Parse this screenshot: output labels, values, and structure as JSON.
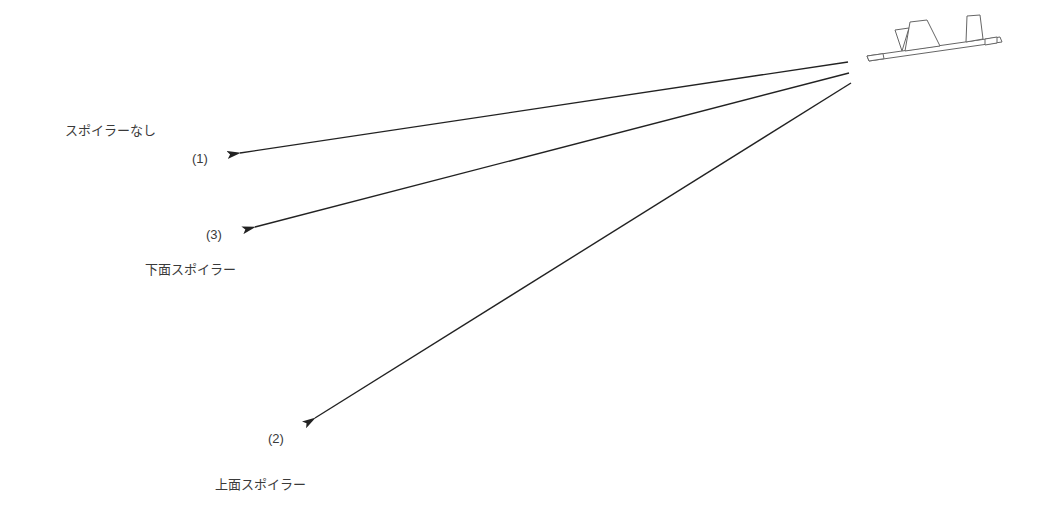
{
  "diagram": {
    "labels": {
      "no_spoiler": "スポイラーなし",
      "lower_spoiler": "下面スポイラー",
      "upper_spoiler": "上面スポイラー"
    },
    "markers": {
      "m1": "(1)",
      "m3": "(3)",
      "m2": "(2)"
    },
    "colors": {
      "line": "#222222",
      "outline": "#666666",
      "text": "#3a3a3a"
    },
    "icons": [
      "wing-with-spoilers-icon",
      "arrow-icon"
    ]
  }
}
